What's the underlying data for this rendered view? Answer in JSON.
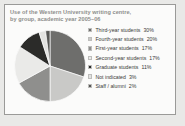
{
  "chart_card": {
    "title_line_1": "Use of the Western University writing centre,",
    "title_line_2": "by group, academic year 2005–06"
  },
  "chart_data": {
    "type": "pie",
    "title": "Use of the Western University writing centre, by group, academic year 2005–06",
    "categories": [
      "Third-year students",
      "Fourth-year students",
      "First-year students",
      "Second-year students",
      "Graduate students",
      "Not indicated",
      "Staff / alumni"
    ],
    "values": [
      30,
      20,
      17,
      17,
      11,
      3,
      2
    ],
    "value_labels": [
      "30%",
      "20%",
      "17%",
      "17%",
      "11%",
      "3%",
      "2%"
    ],
    "unit": "%",
    "colors": [
      "#6e6e6c",
      "#c9c9c7",
      "#8f8f8d",
      "#eaeae8",
      "#2b2b29",
      "#e2e2e0",
      "#565654"
    ],
    "legend_position": "right",
    "start_angle_deg": 0,
    "direction": "clockwise",
    "grid": false,
    "xlabel": "",
    "ylabel": ""
  },
  "legend": {
    "items": [
      {
        "label": "Third-year students",
        "value": "30%",
        "color": "#6e6e6c"
      },
      {
        "label": "Fourth-year students",
        "value": "20%",
        "color": "#c9c9c7"
      },
      {
        "label": "First-year students",
        "value": "17%",
        "color": "#8f8f8d"
      },
      {
        "label": "Second-year students",
        "value": "17%",
        "color": "#eaeae8"
      },
      {
        "label": "Graduate students",
        "value": "11%",
        "color": "#2b2b29"
      },
      {
        "label": "Not indicated",
        "value": "3%",
        "color": "#e2e2e0"
      },
      {
        "label": "Staff / alumni",
        "value": "2%",
        "color": "#565654"
      }
    ]
  }
}
